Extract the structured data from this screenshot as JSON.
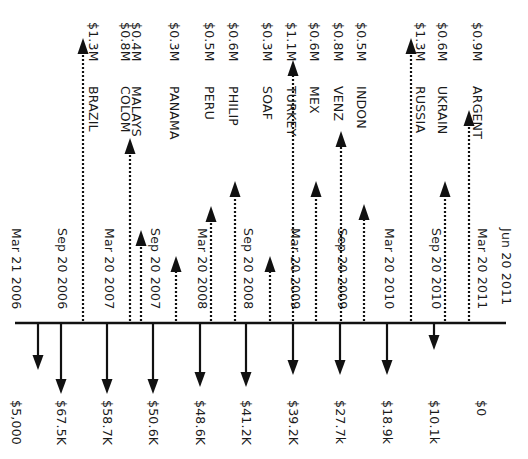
{
  "diagram": {
    "type": "cash-flow-timeline",
    "orientation": "rotated-90-clockwise",
    "colors": {
      "line": "#111111",
      "text": "#1a1a1a",
      "background": "#ffffff"
    },
    "baseline": {
      "y": 323,
      "x_start": 15,
      "x_end": 506
    },
    "dates": [
      {
        "label": "Mar 21 2006",
        "x": 17
      },
      {
        "label": "Sep 20 2006",
        "x": 63
      },
      {
        "label": "Mar 20 2007",
        "x": 110
      },
      {
        "label": "Sep 20 2007",
        "x": 156
      },
      {
        "label": "Mar 20 2008",
        "x": 203
      },
      {
        "label": "Sep 20 2008",
        "x": 249
      },
      {
        "label": "Mar 20 2009",
        "x": 296
      },
      {
        "label": "Sep 20 2009",
        "x": 343
      },
      {
        "label": "Mar 20 2010",
        "x": 390
      },
      {
        "label": "Sep 20 2010",
        "x": 437
      },
      {
        "label": "Mar 20 2011",
        "x": 483
      },
      {
        "label": "Jun 20 2011",
        "x": 507
      }
    ],
    "outflows": [
      {
        "label": "$5,000",
        "x": 38,
        "arrow_x": 38,
        "arrow_end": 368,
        "label_x": 17
      },
      {
        "label": "$67.5K",
        "x": 61,
        "arrow_x": 61,
        "arrow_end": 392,
        "label_x": 62
      },
      {
        "label": "$58.7K",
        "x": 107,
        "arrow_x": 107,
        "arrow_end": 392,
        "label_x": 108
      },
      {
        "label": "$50.6K",
        "x": 153,
        "arrow_x": 153,
        "arrow_end": 392,
        "label_x": 154
      },
      {
        "label": "$48.6K",
        "x": 200,
        "arrow_x": 200,
        "arrow_end": 385,
        "label_x": 201
      },
      {
        "label": "$41.2K",
        "x": 246,
        "arrow_x": 246,
        "arrow_end": 385,
        "label_x": 247
      },
      {
        "label": "$39.2K",
        "x": 293,
        "arrow_x": 293,
        "arrow_end": 373,
        "label_x": 294
      },
      {
        "label": "$27.7k",
        "x": 340,
        "arrow_x": 340,
        "arrow_end": 373,
        "label_x": 341
      },
      {
        "label": "$18.9k",
        "x": 387,
        "arrow_x": 387,
        "arrow_end": 373,
        "label_x": 388
      },
      {
        "label": "$10.1k",
        "x": 434,
        "arrow_x": 434,
        "arrow_end": 348,
        "label_x": 435
      },
      {
        "label": "$0",
        "x": 482,
        "arrow_x": null,
        "arrow_end": null,
        "label_x": 482
      }
    ],
    "inflows": [
      {
        "country": "BRAZIL",
        "amount": "$1.3M",
        "arrow_x": 83,
        "arrow_top": 38,
        "label_x": 94
      },
      {
        "country": "COLOM",
        "amount": "$0.8M",
        "arrow_x": 130,
        "arrow_top": 138,
        "label_x": 126
      },
      {
        "country": "MALAYS",
        "amount": "$0.4M",
        "arrow_x": 141,
        "arrow_top": 230,
        "label_x": 137
      },
      {
        "country": "PANAMA",
        "amount": "$0.3M",
        "arrow_x": 176,
        "arrow_top": 256,
        "label_x": 175
      },
      {
        "country": "PERU",
        "amount": "$0.5M",
        "arrow_x": 211,
        "arrow_top": 206,
        "label_x": 210
      },
      {
        "country": "PHILIP",
        "amount": "$0.6M",
        "arrow_x": 235,
        "arrow_top": 181,
        "label_x": 234
      },
      {
        "country": "SOAF",
        "amount": "$0.3M",
        "arrow_x": 270,
        "arrow_top": 256,
        "label_x": 268
      },
      {
        "country": "TURKEY",
        "amount": "$1.1M",
        "arrow_x": 293,
        "arrow_top": 60,
        "label_x": 292
      },
      {
        "country": "MEX",
        "amount": "$0.6M",
        "arrow_x": 316,
        "arrow_top": 181,
        "label_x": 315
      },
      {
        "country": "VENZ",
        "amount": "$0.8M",
        "arrow_x": 341,
        "arrow_top": 131,
        "label_x": 339
      },
      {
        "country": "INDON",
        "amount": "$0.5M",
        "arrow_x": 364,
        "arrow_top": 204,
        "label_x": 362
      },
      {
        "country": "RUSSIA",
        "amount": "$1.3M",
        "arrow_x": 411,
        "arrow_top": 38,
        "label_x": 421
      },
      {
        "country": "UKRAIN",
        "amount": "$0.6M",
        "arrow_x": 445,
        "arrow_top": 181,
        "label_x": 443
      },
      {
        "country": "ARGENT",
        "amount": "$0.9M",
        "arrow_x": 469,
        "arrow_top": 110,
        "label_x": 478
      }
    ]
  }
}
